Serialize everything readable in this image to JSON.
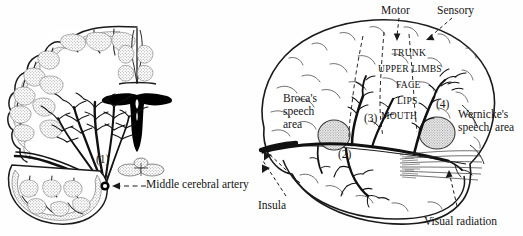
{
  "figure": {
    "background_color": "#fefefe",
    "ink_color": "#141414",
    "hatch_fill_color": "#c9c9c9",
    "ventricle_fill_color": "#000000"
  },
  "panels": {
    "left": {
      "name": "coronal-section",
      "description": "Coronal section of cerebral hemisphere showing middle cerebral artery branches and lateral ventricle",
      "callouts": [
        {
          "id": "marker-1",
          "text": "(1)"
        }
      ],
      "labels": [
        {
          "id": "middle-cerebral-artery",
          "text": "Middle cerebral artery"
        }
      ]
    },
    "right": {
      "name": "lateral-view",
      "description": "Lateral view of left cerebral hemisphere showing speech areas, motor and sensory strips, and middle cerebral artery branches",
      "callouts": [
        {
          "id": "marker-2",
          "text": "(2)"
        },
        {
          "id": "marker-3",
          "text": "(3)"
        },
        {
          "id": "marker-4",
          "text": "(4)"
        }
      ],
      "labels": [
        {
          "id": "motor",
          "text": "Motor"
        },
        {
          "id": "sensory",
          "text": "Sensory"
        },
        {
          "id": "trunk",
          "text": "TRUNK"
        },
        {
          "id": "upper-limbs",
          "text": "UPPER LIMBS"
        },
        {
          "id": "face",
          "text": "FACE"
        },
        {
          "id": "lips",
          "text": "LIPS"
        },
        {
          "id": "mouth",
          "text": "MOUTH"
        },
        {
          "id": "brocas-speech-area",
          "text": "Broca's\nspeech\narea"
        },
        {
          "id": "wernickes-speech-area",
          "text": "Wernicke's\nspeech  area"
        },
        {
          "id": "insula",
          "text": "Insula"
        },
        {
          "id": "visual-radiation",
          "text": "Visual radiation"
        }
      ]
    }
  }
}
